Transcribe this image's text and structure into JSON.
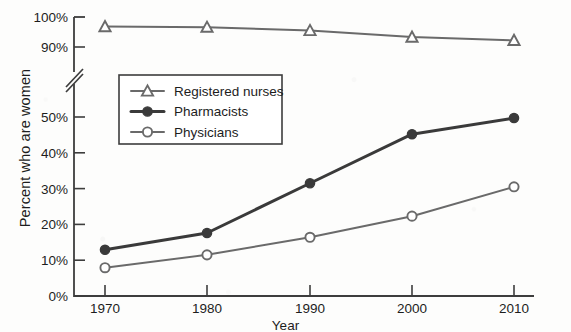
{
  "chart_data": {
    "type": "line",
    "title": "",
    "subtitle": "",
    "xlabel": "Year",
    "ylabel": "Percent who are women",
    "categories": [
      "1970",
      "1980",
      "1990",
      "2000",
      "2010"
    ],
    "x": [
      1970,
      1980,
      1990,
      2000,
      2010
    ],
    "series": [
      {
        "name": "Registered nurses",
        "values": [
          96.8,
          96.6,
          95.5,
          93.3,
          92.2
        ],
        "marker": "open-triangle",
        "color": "#6a6a6a",
        "linewidth": 2.0
      },
      {
        "name": "Pharmacists",
        "values": [
          12.9,
          17.6,
          31.5,
          45.2,
          49.7
        ],
        "marker": "filled-circle",
        "color": "#3a3a3a",
        "linewidth": 3.0
      },
      {
        "name": "Physicians",
        "values": [
          7.9,
          11.5,
          16.4,
          22.3,
          30.5
        ],
        "marker": "open-circle",
        "color": "#6a6a6a",
        "linewidth": 2.0
      }
    ],
    "ytick_labels": [
      "0%",
      "10%",
      "20%",
      "30%",
      "40%",
      "50%",
      "90%",
      "100%"
    ],
    "ytick_values": [
      0,
      10,
      20,
      30,
      40,
      50,
      90,
      100
    ],
    "xtick_labels": [
      "1970",
      "1980",
      "1990",
      "2000",
      "2010"
    ],
    "ylim": [
      0,
      100
    ],
    "xlim": [
      1970,
      2010
    ],
    "axis_break": {
      "present": true,
      "between": [
        50,
        90
      ],
      "style": "double-slash"
    },
    "grid": false,
    "legend_position": "upper-left-inside",
    "legend_border": true,
    "axis_color": "#3d3d3d",
    "text_color": "#1d1d1d",
    "background": "#fdfdfc"
  },
  "legend": {
    "items": [
      {
        "label": "Registered nurses"
      },
      {
        "label": "Pharmacists"
      },
      {
        "label": "Physicians"
      }
    ]
  }
}
